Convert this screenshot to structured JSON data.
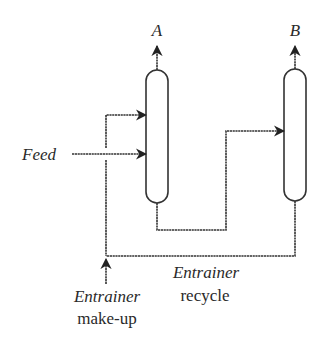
{
  "diagram": {
    "type": "process-flow",
    "columns": [
      {
        "id": "A",
        "label": "A"
      },
      {
        "id": "B",
        "label": "B"
      }
    ],
    "streams": {
      "feed": {
        "label": "Feed"
      },
      "recycle": {
        "label_line1": "Entrainer",
        "label_line2": "recycle"
      },
      "makeup": {
        "label_line1": "Entrainer",
        "label_line2": "make-up"
      }
    },
    "colors": {
      "line": "#333333",
      "text": "#2a2a2a",
      "background": "#ffffff"
    }
  }
}
